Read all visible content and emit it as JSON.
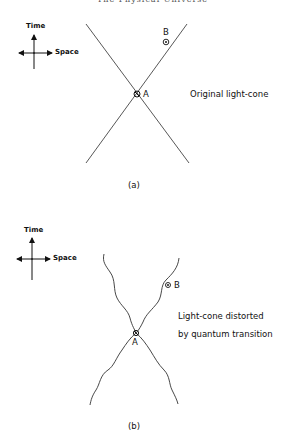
{
  "header": {
    "running_title": "The Physical Universe"
  },
  "panel_a": {
    "axes": {
      "time_label": "Time",
      "space_label": "Space"
    },
    "event_a": "A",
    "event_b": "B",
    "caption_text": "Original light-cone",
    "label": "(a)"
  },
  "panel_b": {
    "axes": {
      "time_label": "Time",
      "space_label": "Space"
    },
    "event_a": "A",
    "event_b": "B",
    "caption_line1": "Light-cone distorted",
    "caption_line2": "by quantum transition",
    "label": "(b)"
  }
}
